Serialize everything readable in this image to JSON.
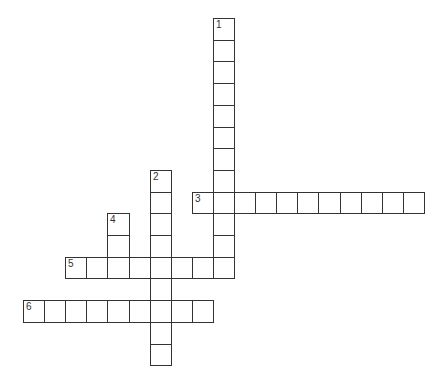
{
  "puzzle": {
    "type": "crossword",
    "grid": {
      "origin_x": 23,
      "origin_y": 18,
      "cell_w": 21.1,
      "cell_h": 21.7,
      "line_color": "#333333",
      "background": "#ffffff"
    },
    "entries": [
      {
        "number": "1",
        "direction": "down",
        "col": 9,
        "row": 0,
        "length": 12
      },
      {
        "number": "2",
        "direction": "down",
        "col": 6,
        "row": 7,
        "length": 9
      },
      {
        "number": "3",
        "direction": "across",
        "col": 8,
        "row": 8,
        "length": 11
      },
      {
        "number": "4",
        "direction": "down",
        "col": 4,
        "row": 9,
        "length": 3
      },
      {
        "number": "5",
        "direction": "across",
        "col": 2,
        "row": 11,
        "length": 8
      },
      {
        "number": "6",
        "direction": "across",
        "col": 0,
        "row": 13,
        "length": 9
      }
    ]
  }
}
